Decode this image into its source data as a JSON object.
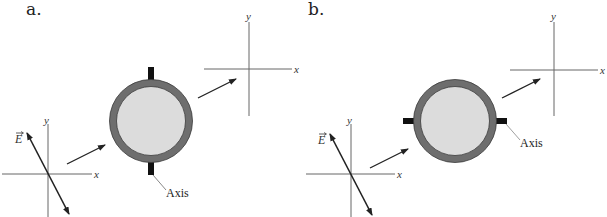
{
  "figure": {
    "panels": [
      {
        "id": "a",
        "label": "a.",
        "e_field_label": "E",
        "input_axes": {
          "x_label": "x",
          "y_label": "y"
        },
        "output_axes": {
          "x_label": "x",
          "y_label": "y"
        },
        "filter_axis_orientation": "vertical",
        "axis_callout": "Axis"
      },
      {
        "id": "b",
        "label": "b.",
        "e_field_label": "E",
        "input_axes": {
          "x_label": "x",
          "y_label": "y"
        },
        "output_axes": {
          "x_label": "x",
          "y_label": "y"
        },
        "filter_axis_orientation": "horizontal",
        "axis_callout": "Axis"
      }
    ],
    "colors": {
      "ring": "#6e6e6e",
      "ring_edge": "#3a3a3a",
      "filter_face": "#dcdcdc",
      "tab": "#111111",
      "lines": "#555555",
      "arrows": "#222222"
    }
  }
}
